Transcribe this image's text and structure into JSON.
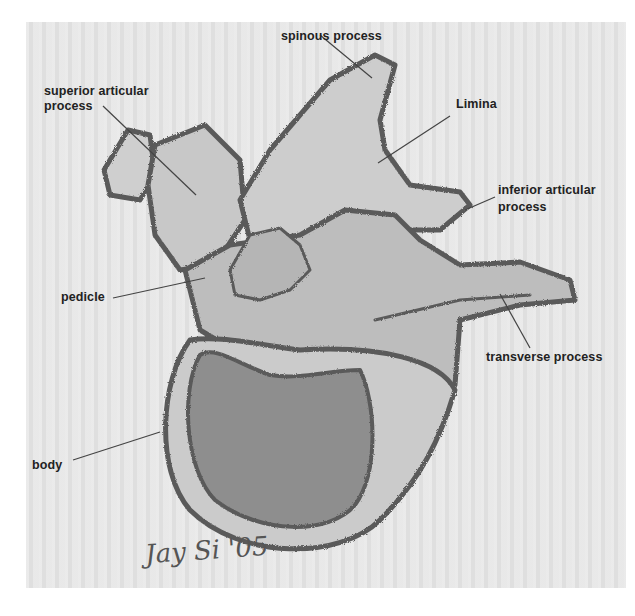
{
  "figure": {
    "signature": "Jay Si '05",
    "labels": [
      {
        "id": "spinous_process",
        "text": "spinous process"
      },
      {
        "id": "superior_articular_line1",
        "text": "superior articular"
      },
      {
        "id": "superior_articular_line2",
        "text": "process"
      },
      {
        "id": "limina",
        "text": "Limina"
      },
      {
        "id": "inferior_articular_line1",
        "text": "inferior articular"
      },
      {
        "id": "inferior_articular_line2",
        "text": "process"
      },
      {
        "id": "pedicle",
        "text": "pedicle"
      },
      {
        "id": "transverse_process",
        "text": "transverse process"
      },
      {
        "id": "body",
        "text": "body"
      }
    ],
    "colors": {
      "paper": "#e6e6e6",
      "bone_fill": "#c4c4c4",
      "body_fill": "#8e8e8e",
      "outline": "#5a5a5a",
      "leader_line": "#444444",
      "text": "#222222"
    }
  }
}
